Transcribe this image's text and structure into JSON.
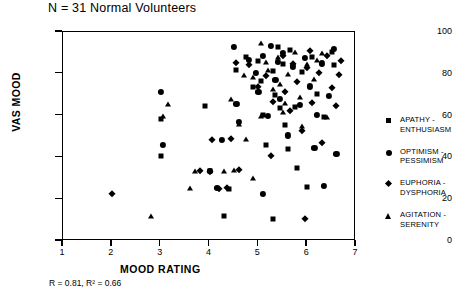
{
  "chart_data": {
    "type": "scatter",
    "title": "N = 31 Normal Volunteers",
    "xlabel": "MOOD RATING",
    "ylabel": "VAS MOOD",
    "xlim": [
      1,
      7
    ],
    "ylim": [
      0,
      100
    ],
    "xticks": [
      1,
      2,
      3,
      4,
      5,
      6,
      7
    ],
    "yticks": [
      0,
      20,
      40,
      60,
      80,
      100
    ],
    "grid": false,
    "legend_position": "right",
    "annotation": "R = 0.81,  R² = 0.66",
    "stats": {
      "r": 0.81,
      "r_squared": 0.66,
      "n": 31
    },
    "series": [
      {
        "name": "APATHY - ENTHUSIASM",
        "marker": "square",
        "color": "#000000",
        "points": [
          [
            3.0,
            58.5
          ],
          [
            3.0,
            40.5
          ],
          [
            3.9,
            64.5
          ],
          [
            4.0,
            33.5
          ],
          [
            4.4,
            25.0
          ],
          [
            4.55,
            82.0
          ],
          [
            4.75,
            88.0
          ],
          [
            4.9,
            73.5
          ],
          [
            5.0,
            86.0
          ],
          [
            5.05,
            76.5
          ],
          [
            5.1,
            60.5
          ],
          [
            5.15,
            46.0
          ],
          [
            5.3,
            81.5
          ],
          [
            5.35,
            70.0
          ],
          [
            5.4,
            93.0
          ],
          [
            5.45,
            63.5
          ],
          [
            5.5,
            84.5
          ],
          [
            5.55,
            55.5
          ],
          [
            5.6,
            44.0
          ],
          [
            5.65,
            91.5
          ],
          [
            5.75,
            64.0
          ],
          [
            5.8,
            35.0
          ],
          [
            5.9,
            81.0
          ],
          [
            6.0,
            26.0
          ],
          [
            6.1,
            88.0
          ],
          [
            6.2,
            70.5
          ],
          [
            6.35,
            59.5
          ],
          [
            6.5,
            90.5
          ],
          [
            4.3,
            12.0
          ],
          [
            5.3,
            10.5
          ],
          [
            6.55,
            84.0
          ]
        ]
      },
      {
        "name": "OPTIMISM - PESSIMISM",
        "marker": "circle",
        "color": "#000000",
        "points": [
          [
            3.0,
            71.5
          ],
          [
            3.05,
            46.0
          ],
          [
            4.0,
            33.5
          ],
          [
            4.15,
            25.5
          ],
          [
            4.25,
            48.5
          ],
          [
            4.5,
            93.0
          ],
          [
            4.55,
            65.5
          ],
          [
            4.6,
            57.0
          ],
          [
            4.8,
            86.5
          ],
          [
            4.95,
            80.5
          ],
          [
            5.0,
            71.5
          ],
          [
            5.1,
            88.5
          ],
          [
            5.2,
            60.0
          ],
          [
            5.25,
            93.5
          ],
          [
            5.35,
            77.0
          ],
          [
            5.4,
            85.5
          ],
          [
            5.45,
            68.0
          ],
          [
            5.5,
            90.0
          ],
          [
            5.6,
            50.5
          ],
          [
            5.7,
            83.5
          ],
          [
            5.85,
            65.0
          ],
          [
            5.95,
            87.5
          ],
          [
            6.05,
            74.0
          ],
          [
            6.15,
            44.5
          ],
          [
            6.2,
            60.5
          ],
          [
            6.3,
            85.0
          ],
          [
            6.45,
            69.5
          ],
          [
            6.55,
            92.0
          ],
          [
            6.6,
            41.5
          ],
          [
            5.1,
            22.5
          ],
          [
            6.35,
            26.5
          ]
        ]
      },
      {
        "name": "EUPHORIA - DYSPHORIA",
        "marker": "diamond",
        "color": "#000000",
        "points": [
          [
            2.0,
            22.5
          ],
          [
            3.8,
            33.5
          ],
          [
            4.2,
            25.0
          ],
          [
            4.35,
            25.5
          ],
          [
            4.45,
            49.0
          ],
          [
            4.55,
            85.0
          ],
          [
            4.8,
            84.0
          ],
          [
            5.0,
            73.5
          ],
          [
            5.15,
            79.0
          ],
          [
            5.3,
            66.5
          ],
          [
            5.5,
            88.5
          ],
          [
            5.55,
            71.5
          ],
          [
            5.65,
            62.0
          ],
          [
            5.7,
            84.5
          ],
          [
            5.8,
            76.0
          ],
          [
            5.9,
            52.5
          ],
          [
            6.0,
            83.0
          ],
          [
            6.05,
            91.0
          ],
          [
            6.1,
            66.0
          ],
          [
            6.25,
            80.5
          ],
          [
            6.3,
            47.0
          ],
          [
            6.4,
            88.5
          ],
          [
            6.5,
            73.0
          ],
          [
            6.6,
            64.5
          ],
          [
            6.7,
            86.0
          ],
          [
            4.0,
            33.0
          ],
          [
            5.95,
            10.5
          ],
          [
            4.05,
            48.5
          ],
          [
            6.65,
            79.5
          ],
          [
            5.25,
            40.5
          ],
          [
            4.6,
            34.0
          ]
        ]
      },
      {
        "name": "AGITATION - SERENITY",
        "marker": "triangle",
        "color": "#000000",
        "points": [
          [
            2.8,
            12.0
          ],
          [
            3.15,
            65.5
          ],
          [
            3.6,
            25.5
          ],
          [
            3.7,
            33.5
          ],
          [
            4.3,
            33.5
          ],
          [
            4.45,
            68.0
          ],
          [
            4.6,
            56.0
          ],
          [
            4.75,
            49.0
          ],
          [
            4.9,
            78.5
          ],
          [
            5.05,
            94.5
          ],
          [
            5.2,
            82.0
          ],
          [
            5.3,
            72.5
          ],
          [
            5.4,
            88.0
          ],
          [
            5.5,
            61.5
          ],
          [
            5.6,
            80.0
          ],
          [
            5.75,
            90.5
          ],
          [
            5.85,
            69.0
          ],
          [
            6.0,
            84.5
          ],
          [
            6.15,
            77.5
          ],
          [
            6.3,
            90.0
          ],
          [
            4.5,
            34.0
          ],
          [
            4.9,
            30.0
          ],
          [
            5.45,
            75.0
          ],
          [
            5.05,
            60.0
          ],
          [
            6.2,
            86.5
          ],
          [
            5.15,
            85.5
          ],
          [
            4.7,
            79.5
          ],
          [
            5.55,
            66.0
          ],
          [
            6.4,
            59.5
          ],
          [
            3.05,
            60.0
          ],
          [
            5.9,
            55.0
          ]
        ]
      }
    ]
  },
  "axes": {
    "y_ticks": [
      {
        "value": 0,
        "label": "0"
      },
      {
        "value": 20,
        "label": "20"
      },
      {
        "value": 40,
        "label": "40"
      },
      {
        "value": 60,
        "label": "60"
      },
      {
        "value": 80,
        "label": "80"
      },
      {
        "value": 100,
        "label": "100"
      }
    ],
    "x_ticks": [
      {
        "value": 1,
        "label": "1"
      },
      {
        "value": 2,
        "label": "2"
      },
      {
        "value": 3,
        "label": "3"
      },
      {
        "value": 4,
        "label": "4"
      },
      {
        "value": 5,
        "label": "5"
      },
      {
        "value": 6,
        "label": "6"
      },
      {
        "value": 7,
        "label": "7"
      }
    ]
  },
  "legend": {
    "entries": [
      {
        "label_line1": "APATHY -",
        "label_line2": "ENTHUSIASM",
        "marker": "square"
      },
      {
        "label_line1": "OPTIMISM -",
        "label_line2": "PESSIMISM",
        "marker": "circle"
      },
      {
        "label_line1": "EUPHORIA -",
        "label_line2": "DYSPHORIA",
        "marker": "diamond"
      },
      {
        "label_line1": "AGITATION -",
        "label_line2": "SERENITY",
        "marker": "triangle"
      }
    ]
  }
}
